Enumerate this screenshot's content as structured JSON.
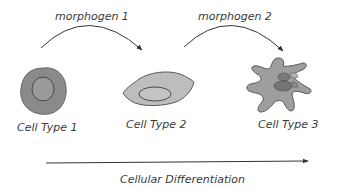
{
  "diagram": {
    "morphogens": [
      {
        "label": "morphogen 1"
      },
      {
        "label": "morphogen 2"
      }
    ],
    "cells": [
      {
        "label": "Cell Type 1",
        "shape": "round-cell"
      },
      {
        "label": "Cell Type 2",
        "shape": "elongated-cell"
      },
      {
        "label": "Cell Type 3",
        "shape": "branched-cell"
      }
    ],
    "axis": {
      "label": "Cellular Differentiation"
    },
    "colors": {
      "cell_fill_dark": "#8a8a8a",
      "cell_fill_light": "#bdbdbd",
      "cell_fill_mid": "#9e9e9e",
      "outline": "#4a4a4a",
      "arrow": "#333333",
      "text": "#3a3a3a"
    }
  }
}
